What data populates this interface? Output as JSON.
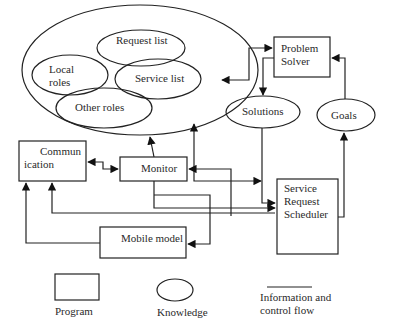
{
  "diagram": {
    "knowledge_base": {
      "items": [
        {
          "id": "request-list",
          "label": "Request list"
        },
        {
          "id": "local-roles",
          "label_lines": [
            "Local",
            "roles"
          ]
        },
        {
          "id": "service-list",
          "label": "Service list"
        },
        {
          "id": "other-roles",
          "label": "Other roles"
        }
      ]
    },
    "nodes": {
      "problem_solver": {
        "type": "program",
        "label_lines": [
          "Problem",
          "Solver"
        ]
      },
      "solutions": {
        "type": "knowledge",
        "label": "Solutions"
      },
      "goals": {
        "type": "knowledge",
        "label": "Goals"
      },
      "communication": {
        "type": "program",
        "label_lines": [
          "Commun",
          "ication"
        ]
      },
      "monitor": {
        "type": "program",
        "label": "Monitor"
      },
      "service_request_scheduler": {
        "type": "program",
        "label_lines": [
          "Service",
          "Request",
          "Scheduler"
        ]
      },
      "mobile_model": {
        "type": "program",
        "label": "Mobile model"
      }
    },
    "edges": [
      {
        "from": "knowledge_base",
        "to": "problem_solver",
        "bidirectional": true
      },
      {
        "from": "problem_solver",
        "to": "solutions"
      },
      {
        "from": "goals",
        "to": "problem_solver"
      },
      {
        "from": "solutions",
        "to": "service_request_scheduler"
      },
      {
        "from": "service_request_scheduler",
        "to": "goals"
      },
      {
        "from": "communication",
        "to": "monitor",
        "bidirectional": true
      },
      {
        "from": "monitor",
        "to": "knowledge_base"
      },
      {
        "from": "service_request_scheduler",
        "to": "knowledge_base"
      },
      {
        "from": "service_request_scheduler",
        "to": "monitor"
      },
      {
        "from": "monitor",
        "to": "service_request_scheduler"
      },
      {
        "from": "monitor",
        "to": "mobile_model"
      },
      {
        "from": "service_request_scheduler",
        "to": "communication"
      },
      {
        "from": "mobile_model",
        "to": "communication"
      },
      {
        "from": "knowledge_base",
        "to": "service_request_scheduler"
      }
    ],
    "legend": {
      "program": "Program",
      "knowledge": "Knowledge",
      "flow_lines": [
        "Information and",
        "control flow"
      ]
    }
  }
}
